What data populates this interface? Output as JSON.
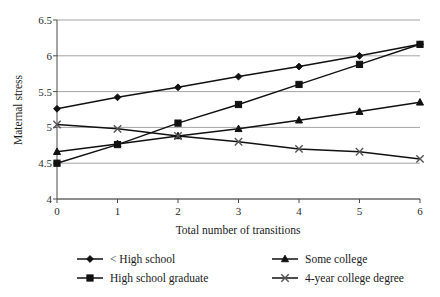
{
  "chart_data": {
    "type": "line",
    "title": "",
    "xlabel": "Total number of transitions",
    "ylabel": "Maternal stress",
    "x": [
      0,
      1,
      2,
      3,
      4,
      5,
      6
    ],
    "xtick_labels": [
      "0",
      "1",
      "2",
      "3",
      "4",
      "5",
      "6"
    ],
    "ytick_labels": [
      "4",
      "4.5",
      "5",
      "5.5",
      "6",
      "6.5"
    ],
    "xlim": [
      0,
      6
    ],
    "ylim": [
      4,
      6.5
    ],
    "ytick_values": [
      4,
      4.5,
      5,
      5.5,
      6,
      6.5
    ],
    "grid": "horizontal",
    "legend_position": "bottom",
    "series": [
      {
        "name": "< High school",
        "marker": "diamond",
        "values": [
          5.26,
          5.42,
          5.56,
          5.71,
          5.85,
          6.0,
          6.16
        ]
      },
      {
        "name": "High school graduate",
        "marker": "square",
        "values": [
          4.5,
          4.76,
          5.06,
          5.32,
          5.6,
          5.88,
          6.16
        ]
      },
      {
        "name": "Some college",
        "marker": "triangle",
        "values": [
          4.66,
          4.77,
          4.88,
          4.98,
          5.1,
          5.22,
          5.35
        ]
      },
      {
        "name": "4-year college degree",
        "marker": "cross",
        "values": [
          5.04,
          4.98,
          4.88,
          4.8,
          4.7,
          4.66,
          4.56
        ]
      }
    ]
  },
  "legend": {
    "entries": [
      {
        "label": "< High school",
        "marker": "diamond"
      },
      {
        "label": "Some college",
        "marker": "triangle"
      },
      {
        "label": "High school graduate",
        "marker": "square"
      },
      {
        "label": "4-year college degree",
        "marker": "cross"
      }
    ]
  },
  "colors": {
    "line": "#111111",
    "grid": "#9a9a9a",
    "axis": "#4a4a4a",
    "text": "#1a1a1a",
    "background": "#ffffff"
  }
}
